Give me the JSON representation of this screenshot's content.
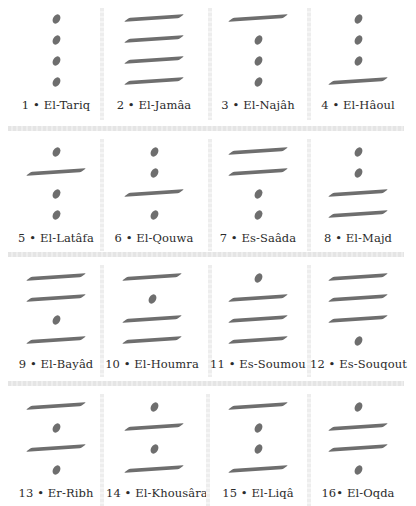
{
  "diagram": {
    "colors": {
      "mark": "#6e6e6e",
      "label": "#2b2b2b",
      "separator": "#e5e5e5",
      "background": "#ffffff"
    },
    "figures": [
      {
        "number": "1",
        "name": "El-Tariq",
        "label": "1 • El-Tariq",
        "levels": [
          "dot",
          "dot",
          "dot",
          "dot"
        ]
      },
      {
        "number": "2",
        "name": "El-Jamâa",
        "label": "2 • El-Jamâa",
        "levels": [
          "line",
          "line",
          "line",
          "line"
        ]
      },
      {
        "number": "3",
        "name": "El-Najâh",
        "label": "3 • El-Najâh",
        "levels": [
          "line",
          "dot",
          "dot",
          "dot"
        ]
      },
      {
        "number": "4",
        "name": "El-Hâoul",
        "label": "4 • El-Hâoul",
        "levels": [
          "dot",
          "dot",
          "dot",
          "line"
        ]
      },
      {
        "number": "5",
        "name": "El-Latâfa",
        "label": "5 • El-Latâfa",
        "levels": [
          "dot",
          "line",
          "dot",
          "dot"
        ]
      },
      {
        "number": "6",
        "name": "El-Qouwa",
        "label": "6 • El-Qouwa",
        "levels": [
          "dot",
          "dot",
          "line",
          "dot"
        ]
      },
      {
        "number": "7",
        "name": "Es-Saâda",
        "label": "7 • Es-Saâda",
        "levels": [
          "line",
          "line",
          "dot",
          "dot"
        ]
      },
      {
        "number": "8",
        "name": "El-Majd",
        "label": "8 • El-Majd",
        "levels": [
          "dot",
          "dot",
          "line",
          "line"
        ]
      },
      {
        "number": "9",
        "name": "El-Bayâd",
        "label": "9 • El-Bayâd",
        "levels": [
          "line",
          "line",
          "dot",
          "line"
        ]
      },
      {
        "number": "10",
        "name": "El-Houmra",
        "label": "10 • El-Houmra",
        "levels": [
          "line",
          "dot",
          "line",
          "line"
        ]
      },
      {
        "number": "11",
        "name": "Es-Soumou",
        "label": "11 • Es-Soumou",
        "levels": [
          "dot",
          "line",
          "line",
          "line"
        ]
      },
      {
        "number": "12",
        "name": "Es-Souqout",
        "label": "12 • Es-Souqout",
        "levels": [
          "line",
          "line",
          "line",
          "dot"
        ]
      },
      {
        "number": "13",
        "name": "Er-Ribh",
        "label": "13 • Er-Ribh",
        "levels": [
          "line",
          "dot",
          "line",
          "dot"
        ]
      },
      {
        "number": "14",
        "name": "El-Khousâra",
        "label": "14 • El-Khousâra",
        "levels": [
          "dot",
          "line",
          "dot",
          "line"
        ]
      },
      {
        "number": "15",
        "name": "El-Liqâ",
        "label": "15 • El-Liqâ",
        "levels": [
          "line",
          "dot",
          "dot",
          "line"
        ]
      },
      {
        "number": "16",
        "name": "El-Oqda",
        "label": "16• El-Oqda",
        "levels": [
          "dot",
          "line",
          "line",
          "dot"
        ]
      }
    ]
  }
}
